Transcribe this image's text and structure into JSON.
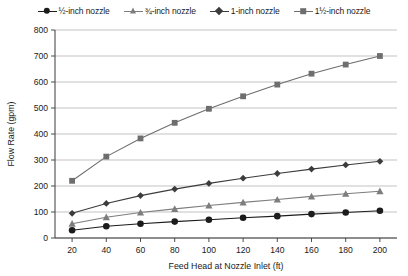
{
  "chart_data": {
    "type": "line",
    "title": "",
    "xlabel": "Feed Head at Nozzle Inlet (ft)",
    "ylabel": "Flow Rate (gpm)",
    "x": [
      20,
      40,
      60,
      80,
      100,
      120,
      140,
      160,
      180,
      200
    ],
    "xlim": [
      10,
      210
    ],
    "ylim": [
      0,
      800
    ],
    "xticks": [
      "20",
      "40",
      "60",
      "80",
      "100",
      "120",
      "140",
      "160",
      "180",
      "200"
    ],
    "yticks": [
      "0",
      "100",
      "200",
      "300",
      "400",
      "500",
      "600",
      "700",
      "800"
    ],
    "grid": "horizontal",
    "legend_position": "top",
    "series": [
      {
        "name": "½-inch nozzle",
        "marker": "circle",
        "color": "#1c1c1c",
        "values": [
          30,
          45,
          55,
          63,
          70,
          78,
          84,
          92,
          98,
          105
        ]
      },
      {
        "name": "¾-inch nozzle",
        "marker": "triangle",
        "color": "#7d7d7d",
        "values": [
          55,
          80,
          98,
          112,
          125,
          137,
          148,
          160,
          170,
          180
        ]
      },
      {
        "name": "1-inch nozzle",
        "marker": "diamond",
        "color": "#3c3c3c",
        "values": [
          95,
          133,
          163,
          188,
          210,
          230,
          248,
          265,
          281,
          295
        ]
      },
      {
        "name": "1½-inch nozzle",
        "marker": "square",
        "color": "#6e6e6e",
        "values": [
          220,
          313,
          383,
          443,
          497,
          545,
          590,
          632,
          667,
          700
        ]
      }
    ]
  },
  "legend": {
    "items": [
      {
        "label": "½-inch nozzle"
      },
      {
        "label": "¾-inch nozzle"
      },
      {
        "label": "1-inch nozzle"
      },
      {
        "label": "1½-inch nozzle"
      }
    ]
  },
  "axes": {
    "x_title": "Feed Head at Nozzle Inlet (ft)",
    "y_title": "Flow Rate (gpm)"
  },
  "colors": {
    "grid": "#b4b4b4",
    "axis": "#3a3a3a",
    "series_half": "#1c1c1c",
    "series_threequarter": "#7d7d7d",
    "series_one": "#3c3c3c",
    "series_onehalf": "#6e6e6e"
  }
}
